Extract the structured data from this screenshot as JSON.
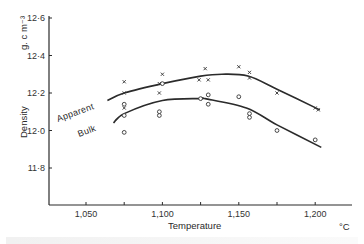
{
  "chart_data": {
    "type": "scatter",
    "title": "",
    "xlabel": "Temperature",
    "xunit": "°C",
    "ylabel": "Density",
    "yunit": "g. c m-3",
    "xlim": [
      1025,
      1225
    ],
    "ylim": [
      11.7,
      12.6
    ],
    "x_ticks": [
      1050,
      1075,
      1100,
      1125,
      1150,
      1175,
      1200
    ],
    "x_tick_labels": [
      "1,050",
      "",
      "1,100",
      "",
      "1,150",
      "",
      "1,200"
    ],
    "y_ticks": [
      12.6,
      12.4,
      12.2,
      12.0,
      11.8
    ],
    "y_tick_labels": [
      "12·6",
      "12·4",
      "12·2",
      "12·0",
      "11·8"
    ],
    "grid": false,
    "legend": "inline curve labels",
    "series": [
      {
        "name": "Apparent",
        "marker": "x",
        "points": [
          [
            1075,
            12.26
          ],
          [
            1075,
            12.2
          ],
          [
            1075,
            12.12
          ],
          [
            1100,
            12.3
          ],
          [
            1098,
            12.25
          ],
          [
            1098,
            12.2
          ],
          [
            1128,
            12.33
          ],
          [
            1124,
            12.27
          ],
          [
            1130,
            12.27
          ],
          [
            1150,
            12.34
          ],
          [
            1157,
            12.31
          ],
          [
            1157,
            12.28
          ],
          [
            1175,
            12.2
          ],
          [
            1200,
            12.12
          ],
          [
            1202,
            12.11
          ]
        ],
        "fit_curve": [
          [
            1064,
            12.16
          ],
          [
            1075,
            12.2
          ],
          [
            1100,
            12.25
          ],
          [
            1125,
            12.29
          ],
          [
            1139,
            12.3
          ],
          [
            1156,
            12.29
          ],
          [
            1175,
            12.22
          ],
          [
            1203,
            12.11
          ]
        ]
      },
      {
        "name": "Bulk",
        "marker": "o",
        "points": [
          [
            1075,
            12.14
          ],
          [
            1075,
            12.08
          ],
          [
            1075,
            11.99
          ],
          [
            1100,
            12.25
          ],
          [
            1098,
            12.1
          ],
          [
            1098,
            12.08
          ],
          [
            1125,
            12.17
          ],
          [
            1130,
            12.19
          ],
          [
            1130,
            12.14
          ],
          [
            1150,
            12.18
          ],
          [
            1157,
            12.09
          ],
          [
            1157,
            12.07
          ],
          [
            1175,
            12.0
          ],
          [
            1200,
            11.95
          ]
        ],
        "fit_curve": [
          [
            1068,
            12.04
          ],
          [
            1075,
            12.09
          ],
          [
            1100,
            12.16
          ],
          [
            1125,
            12.17
          ],
          [
            1128,
            12.17
          ],
          [
            1155,
            12.12
          ],
          [
            1175,
            12.03
          ],
          [
            1204,
            11.91
          ]
        ]
      }
    ]
  },
  "labels": {
    "y_unit": "g. c m⁻³",
    "y_title": "Density",
    "x_title": "Temperature",
    "x_unit": "°C",
    "apparent": "Apparent",
    "bulk": "Bulk"
  }
}
